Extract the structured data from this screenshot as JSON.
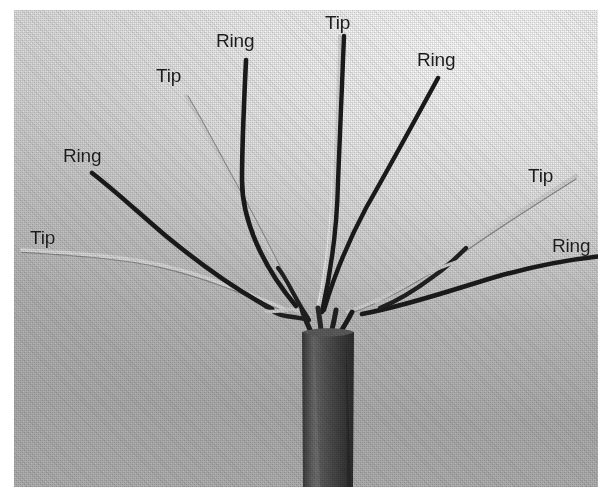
{
  "figure": {
    "kind": "photograph",
    "background_light": "#e6e6e6",
    "background_dark": "#b0b0b0",
    "wire_dark": "#242424",
    "wire_light": "#d8d8d8",
    "jacket": "#4a4a4a"
  },
  "labels": [
    {
      "id": "tip-left",
      "text": "Tip",
      "x": 30,
      "y": 228
    },
    {
      "id": "ring-left",
      "text": "Ring",
      "x": 63,
      "y": 146
    },
    {
      "id": "tip-midleft",
      "text": "Tip",
      "x": 156,
      "y": 66
    },
    {
      "id": "ring-midleft",
      "text": "Ring",
      "x": 216,
      "y": 31
    },
    {
      "id": "tip-center",
      "text": "Tip",
      "x": 325,
      "y": 13
    },
    {
      "id": "ring-midright",
      "text": "Ring",
      "x": 417,
      "y": 50
    },
    {
      "id": "tip-right",
      "text": "Tip",
      "x": 528,
      "y": 166
    },
    {
      "id": "ring-right",
      "text": "Ring",
      "x": 552,
      "y": 236
    }
  ],
  "pairs": [
    {
      "id": "pair-1-left",
      "tip_label": "Tip",
      "ring_label": "Ring"
    },
    {
      "id": "pair-2-midleft",
      "tip_label": "Tip",
      "ring_label": "Ring"
    },
    {
      "id": "pair-3-center",
      "tip_label": "Tip",
      "ring_label": "Ring"
    },
    {
      "id": "pair-4-right",
      "tip_label": "Tip",
      "ring_label": "Ring"
    }
  ]
}
